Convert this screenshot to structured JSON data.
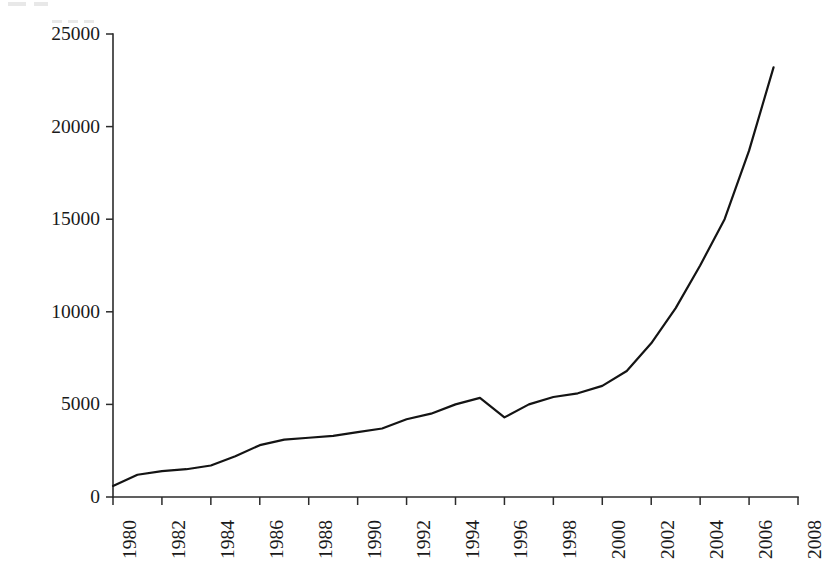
{
  "figure": {
    "background_color": "#ffffff",
    "line_color": "#141414",
    "axis_color": "#2b2b2b"
  },
  "chart_data": {
    "type": "line",
    "title": "",
    "xlabel": "",
    "ylabel": "Ethanol Production (million liters per year)",
    "xlim": [
      1980,
      2008
    ],
    "ylim": [
      0,
      25000
    ],
    "grid": false,
    "legend": null,
    "x_tick_labels": [
      "1980",
      "1982",
      "1984",
      "1986",
      "1988",
      "1990",
      "1992",
      "1994",
      "1996",
      "1998",
      "2000",
      "2002",
      "2004",
      "2006",
      "2008"
    ],
    "x_tick_values": [
      1980,
      1982,
      1984,
      1986,
      1988,
      1990,
      1992,
      1994,
      1996,
      1998,
      2000,
      2002,
      2004,
      2006,
      2008
    ],
    "y_tick_labels": [
      "0",
      "5000",
      "10000",
      "15000",
      "20000",
      "25000"
    ],
    "y_tick_values": [
      0,
      5000,
      10000,
      15000,
      20000,
      25000
    ],
    "x": [
      1980,
      1981,
      1982,
      1983,
      1984,
      1985,
      1986,
      1987,
      1988,
      1989,
      1990,
      1991,
      1992,
      1993,
      1994,
      1995,
      1996,
      1997,
      1998,
      1999,
      2000,
      2001,
      2002,
      2003,
      2004,
      2005,
      2006,
      2007
    ],
    "values": [
      600,
      1200,
      1400,
      1500,
      1700,
      2200,
      2800,
      3100,
      3200,
      3300,
      3500,
      3700,
      4200,
      4500,
      5000,
      5350,
      4300,
      5000,
      5400,
      5600,
      6000,
      6800,
      8300,
      10200,
      12500,
      15000,
      18700,
      23200
    ],
    "series": [
      {
        "name": "Ethanol Production",
        "values": [
          600,
          1200,
          1400,
          1500,
          1700,
          2200,
          2800,
          3100,
          3200,
          3300,
          3500,
          3700,
          4200,
          4500,
          5000,
          5350,
          4300,
          5000,
          5400,
          5600,
          6000,
          6800,
          8300,
          10200,
          12500,
          15000,
          18700,
          23200
        ]
      }
    ]
  }
}
